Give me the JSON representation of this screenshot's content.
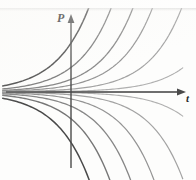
{
  "figure": {
    "background_color": "#fdfdfc",
    "width": 196,
    "height": 180
  },
  "axes": {
    "vertical": {
      "label": "P",
      "name": "p-axis",
      "color": "#4a4a4a",
      "x": 71,
      "y_top": 16,
      "y_bottom": 168,
      "arrow": "up"
    },
    "horizontal": {
      "label": "t",
      "name": "t-axis",
      "color": "#4a4a4a",
      "y": 92,
      "x_left": 6,
      "x_right": 186,
      "arrow": "right"
    }
  },
  "chart_data": {
    "type": "line",
    "xlabel": "t",
    "ylabel": "P",
    "xlim": [
      -2.2,
      3.6
    ],
    "ylim": [
      -2.6,
      2.6
    ],
    "grid": false,
    "legend": false,
    "equilibrium": 0,
    "series": [
      {
        "name": "C = 1.55",
        "c": 1.55,
        "color": "#3a3a3a",
        "width": 1.5
      },
      {
        "name": "C = 0.78",
        "c": 0.78,
        "color": "#6e6e6e",
        "width": 1.3
      },
      {
        "name": "C = 0.40",
        "c": 0.4,
        "color": "#7a7a7a",
        "width": 1.3
      },
      {
        "name": "C = 0.22",
        "c": 0.22,
        "color": "#8a8a8a",
        "width": 1.2
      },
      {
        "name": "C = 0.09",
        "c": 0.09,
        "color": "#9a9a9a",
        "width": 1.2
      },
      {
        "name": "C = 0.025",
        "c": 0.025,
        "color": "#a8a8a8",
        "width": 1.1
      },
      {
        "name": "C = 0.00",
        "c": 0.0,
        "color": "#b4b4b4",
        "width": 1.1
      },
      {
        "name": "C = -0.025",
        "c": -0.025,
        "color": "#a8a8a8",
        "width": 1.1
      },
      {
        "name": "C = -0.09",
        "c": -0.09,
        "color": "#9a9a9a",
        "width": 1.2
      },
      {
        "name": "C = -0.22",
        "c": -0.22,
        "color": "#8a8a8a",
        "width": 1.2
      },
      {
        "name": "C = -0.45",
        "c": -0.45,
        "color": "#7c7c7c",
        "width": 1.3
      },
      {
        "name": "C = -0.85",
        "c": -0.85,
        "color": "#6a6a6a",
        "width": 1.4
      },
      {
        "name": "C = -1.60",
        "c": -1.6,
        "color": "#3a3a3a",
        "width": 1.5
      }
    ],
    "growth_rate": 0.95,
    "samples": 90
  }
}
